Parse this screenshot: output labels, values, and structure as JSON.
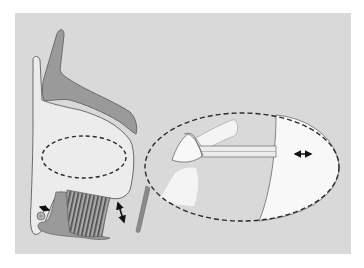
{
  "figure": {
    "colors": {
      "page_background": "#ffffff",
      "panel_background": "#d9d9d9",
      "tissue_light": "#ececec",
      "tissue_highlight": "#f8f8f8",
      "tissue_dark": "#8f8f8f",
      "outline": "#5a5a5a",
      "dashed_line": "#2a2a2a",
      "arrow": "#111111"
    },
    "annotations": {
      "small_arrow_left": "double-headed arrow (horizontal, small) near round structure",
      "vertical_arrow": "double-headed arrow (vertical) between striated tissue and bar",
      "inset_arrow": "double-headed arrow (horizontal) inside magnified inset"
    }
  }
}
